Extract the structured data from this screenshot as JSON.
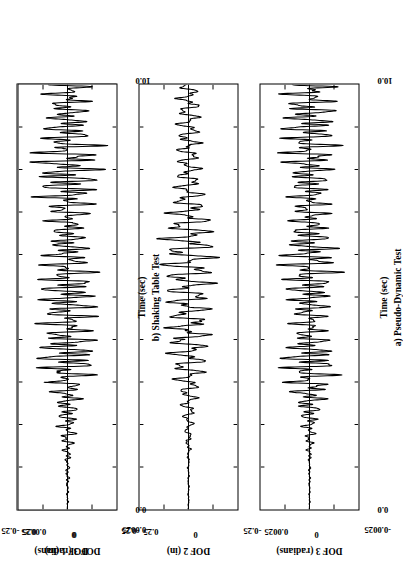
{
  "figure": {
    "rotation_note": "figure printed sideways on page",
    "columns": [
      {
        "id": "col-a",
        "caption": "a) Pseudo-Dynamic Test",
        "xlabel": "Time (sec)"
      },
      {
        "id": "col-b",
        "caption": "b) Shaking Table Test",
        "xlabel": "Time (sec)"
      }
    ],
    "rows": [
      {
        "id": "dof1",
        "ylabel": "DOF 1 (in)",
        "yticks": [
          "0.25",
          "0",
          "-0.25"
        ]
      },
      {
        "id": "dof2",
        "ylabel": "DOF 2 (in)",
        "yticks": [
          "0.25",
          "0",
          "-0.25"
        ]
      },
      {
        "id": "dof3",
        "ylabel": "DOF 3 (radians)",
        "yticks": [
          "0.0025",
          "0",
          "-0.0025"
        ]
      }
    ],
    "xticks": [
      "0.0",
      "10.0"
    ]
  },
  "chart_data": {
    "type": "line",
    "title": "",
    "subtitle": "",
    "layout": {
      "rows": 3,
      "cols": 2,
      "grid": false,
      "legend": false
    },
    "xlabel": "Time (sec)",
    "xlim": [
      0.0,
      10.0
    ],
    "xticks": [
      0.0,
      10.0
    ],
    "x_minor_tick_count": 10,
    "panels": [
      {
        "name": "a-dof1",
        "column_caption": "a) Pseudo-Dynamic Test",
        "ylabel": "DOF 1 (in)",
        "ylim": [
          -0.25,
          0.25
        ],
        "yticks": [
          0.25,
          0,
          -0.25
        ],
        "ytick_labels": [
          "0.25",
          "0",
          "-0.25"
        ],
        "description": "Displacement time history, DOF 1, pseudo-dynamic test. Near-zero until t~1.6s, irregular low-amplitude motion 1.6-3.0s peaking ~0.07 in, then large sustained harmonic-like oscillation from t~3.2s with peak ~0.21 in near t=3.6s decaying slowly to ~0.13 in at t=10s.",
        "envelope_x": [
          0.0,
          1.2,
          1.7,
          2.1,
          2.5,
          3.0,
          3.3,
          3.6,
          4.2,
          5.0,
          6.0,
          7.0,
          8.0,
          9.0,
          10.0
        ],
        "envelope_pos": [
          0.002,
          0.006,
          0.03,
          0.045,
          0.07,
          0.055,
          0.15,
          0.215,
          0.18,
          0.165,
          0.16,
          0.15,
          0.145,
          0.14,
          0.135
        ],
        "dominant_period_sec": 0.33
      },
      {
        "name": "a-dof2",
        "column_caption": "a) Pseudo-Dynamic Test",
        "ylabel": "DOF 2 (in)",
        "ylim": [
          -0.25,
          0.25
        ],
        "yticks": [
          0.25,
          0,
          -0.25
        ],
        "ytick_labels": [
          "0.25",
          "0",
          "-0.25"
        ],
        "description": "Displacement time history, DOF 2, pseudo-dynamic test. Quiet until t~1.6s, then oscillation building to a broad maximum ~0.15 in around t=4.5-6.0s, decaying to ~0.05 in by t=10s.",
        "envelope_x": [
          0.0,
          1.2,
          1.7,
          2.2,
          2.8,
          3.4,
          4.0,
          4.8,
          5.6,
          6.4,
          7.2,
          8.2,
          9.2,
          10.0
        ],
        "envelope_pos": [
          0.002,
          0.006,
          0.022,
          0.035,
          0.05,
          0.095,
          0.13,
          0.15,
          0.145,
          0.13,
          0.105,
          0.08,
          0.06,
          0.05
        ],
        "dominant_period_sec": 0.3
      },
      {
        "name": "a-dof3",
        "column_caption": "a) Pseudo-Dynamic Test",
        "ylabel": "DOF 3 (radians)",
        "ylim": [
          -0.0025,
          0.0025
        ],
        "yticks": [
          0.0025,
          0,
          -0.0025
        ],
        "ytick_labels": [
          "0.0025",
          "0",
          "-0.0025"
        ],
        "description": "Rotation time history, DOF 3, pseudo-dynamic test. Quiet until t~1.6s, irregular beating response with peaks ~0.0019 rad near t=3.5s and ~0.0016 rad near t=8.5s; strongly modulated, two-frequency content.",
        "envelope_x": [
          0.0,
          1.2,
          1.7,
          2.3,
          2.9,
          3.5,
          4.2,
          5.0,
          5.8,
          6.6,
          7.4,
          8.4,
          9.2,
          10.0
        ],
        "envelope_pos": [
          2e-05,
          8e-05,
          0.0003,
          0.00055,
          0.0011,
          0.0019,
          0.0012,
          0.0013,
          0.0015,
          0.0011,
          0.0014,
          0.0016,
          0.0013,
          0.0014
        ],
        "dominant_period_sec": 0.27
      },
      {
        "name": "b-dof1",
        "column_caption": "b) Shaking Table Test",
        "ylabel": "DOF 1 (in)",
        "ylim": [
          -0.25,
          0.25
        ],
        "yticks": [
          0.25,
          0,
          -0.25
        ],
        "ytick_labels": [
          "0.25",
          "0",
          "-0.25"
        ],
        "description": "Displacement time history, DOF 1, shaking table test. Near-zero to t~1.5s, noisy small motion to t~3.2s peaking ~0.075 in, then large sustained oscillation peaking ~0.215 in at t~3.5s decaying to ~0.12 in by t=10s.",
        "envelope_x": [
          0.0,
          1.2,
          1.6,
          2.1,
          2.6,
          3.1,
          3.5,
          4.1,
          5.0,
          6.0,
          7.0,
          8.0,
          9.0,
          10.0
        ],
        "envelope_pos": [
          0.003,
          0.01,
          0.035,
          0.05,
          0.075,
          0.06,
          0.215,
          0.175,
          0.16,
          0.15,
          0.14,
          0.135,
          0.13,
          0.125
        ],
        "dominant_period_sec": 0.33
      },
      {
        "name": "b-dof2",
        "column_caption": "b) Shaking Table Test",
        "ylabel": "DOF 2 (in)",
        "ylim": [
          -0.25,
          0.25
        ],
        "yticks": [
          0.25,
          0,
          -0.25
        ],
        "ytick_labels": [
          "0.25",
          "0",
          "-0.25"
        ],
        "description": "Displacement time history, DOF 2, shaking table test. Small noisy motion to t~3s, rises to maximum ~0.145 in around t=4.5-5.5s then decays steadily to ~0.045 in at t=10s.",
        "envelope_x": [
          0.0,
          1.2,
          1.7,
          2.3,
          2.9,
          3.5,
          4.2,
          5.0,
          5.8,
          6.6,
          7.4,
          8.4,
          9.2,
          10.0
        ],
        "envelope_pos": [
          0.003,
          0.01,
          0.025,
          0.038,
          0.055,
          0.1,
          0.135,
          0.145,
          0.135,
          0.12,
          0.095,
          0.072,
          0.055,
          0.045
        ],
        "dominant_period_sec": 0.3
      },
      {
        "name": "b-dof3",
        "column_caption": "b) Shaking Table Test",
        "ylabel": "DOF 3 (radians)",
        "ylim": [
          -0.0025,
          0.0025
        ],
        "yticks": [
          0.0025,
          0,
          -0.0025
        ],
        "ytick_labels": [
          "0.0025",
          "0",
          "-0.0025"
        ],
        "description": "Rotation time history, DOF 3, shaking table test. Quiet to t~1.5s, irregular beating with peaks ~0.0022 rad near t=3.4s, continued strong modulated response ~0.0015-0.0020 rad through t=10s.",
        "envelope_x": [
          0.0,
          1.2,
          1.7,
          2.3,
          2.9,
          3.4,
          4.2,
          5.0,
          5.8,
          6.6,
          7.4,
          8.4,
          9.2,
          10.0
        ],
        "envelope_pos": [
          3e-05,
          0.00012,
          0.0004,
          0.00065,
          0.0012,
          0.0022,
          0.0013,
          0.0015,
          0.0017,
          0.0012,
          0.0016,
          0.0018,
          0.0014,
          0.0016
        ],
        "dominant_period_sec": 0.27
      }
    ]
  }
}
